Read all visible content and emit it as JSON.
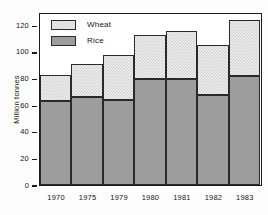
{
  "chart_data": {
    "type": "bar",
    "stacked": true,
    "title": "",
    "xlabel": "",
    "ylabel": "Million tonnes",
    "ylim": [
      0,
      130
    ],
    "yticks": [
      0,
      20,
      40,
      60,
      80,
      100,
      120
    ],
    "ytick_labels": [
      "0",
      "20",
      "40",
      "60",
      "80",
      "100",
      "120"
    ],
    "grid": false,
    "legend_position": "top-left-inside",
    "categories": [
      "1970",
      "1975",
      "1979",
      "1980",
      "1981",
      "1982",
      "1983"
    ],
    "series": [
      {
        "name": "Rice",
        "color": "#9d9d9d",
        "values": [
          63,
          66,
          64,
          80,
          80,
          68,
          82
        ]
      },
      {
        "name": "Wheat",
        "color": "#eeeeee",
        "values": [
          20,
          25,
          34,
          33,
          36,
          37,
          42
        ]
      }
    ],
    "totals": [
      83,
      91,
      98,
      113,
      116,
      105,
      124
    ]
  },
  "legend": {
    "items": [
      {
        "label": "Wheat",
        "swatch": "wheat-swatch"
      },
      {
        "label": "Rice",
        "swatch": "rice-swatch"
      }
    ]
  }
}
